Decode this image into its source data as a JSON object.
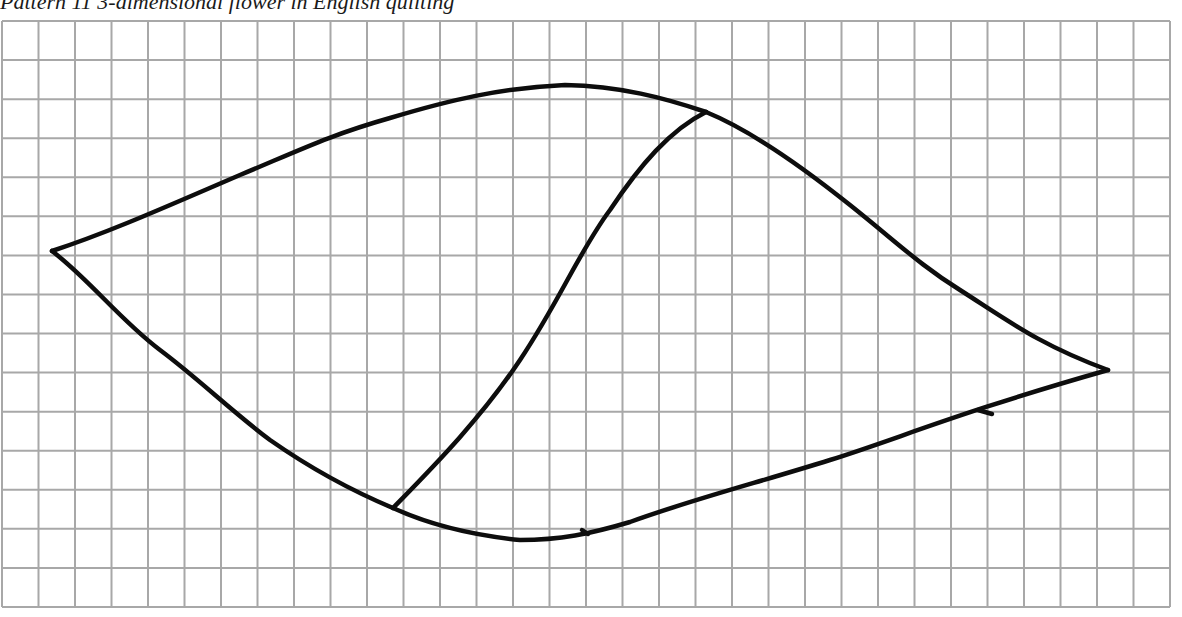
{
  "caption": {
    "text": "Pattern 11 3-dimensional flower in English quilting"
  },
  "grid": {
    "x0": 2,
    "y0": 21,
    "x1": 1170,
    "y1": 607,
    "cols": 32,
    "rows": 15,
    "line_color": "#a8a8a8",
    "paper_color": "#ffffff"
  },
  "pattern": {
    "stroke_color": "#0d0d0d",
    "stroke_width": 4.5,
    "points": {
      "left_tip": [
        52,
        251
      ],
      "right_tip": [
        1108,
        370
      ],
      "top_junction": [
        706,
        112
      ],
      "bottom_junction": [
        393,
        508
      ],
      "top_peak": [
        565,
        85
      ],
      "bottom_low": [
        520,
        540
      ]
    },
    "paths": {
      "upper_left_curve": "M52,251 C110,232 170,205 240,175 C300,150 330,135 390,118 C450,100 500,88 565,85 C620,86 665,98 706,112",
      "upper_right_curve": "M706,112 C750,130 800,165 850,205 C900,245 920,265 960,290 C1010,322 1040,345 1108,370",
      "lower_left_curve": "M52,251 C90,280 120,320 160,350 C200,380 230,410 270,440 C310,468 350,490 393,508",
      "lower_right_curve": "M393,508 C430,525 470,535 520,540 C560,540 590,534 630,522 C690,500 760,482 830,460 C900,438 960,412 1108,370",
      "center_curve": "M393,508 C430,470 480,420 520,360 C560,300 580,250 610,210 C640,165 670,130 706,112"
    },
    "marks": [
      {
        "name": "lower-right-tick",
        "path": "M978,410 L992,414"
      },
      {
        "name": "bottom-tick",
        "path": "M582,530 L588,534"
      }
    ]
  }
}
